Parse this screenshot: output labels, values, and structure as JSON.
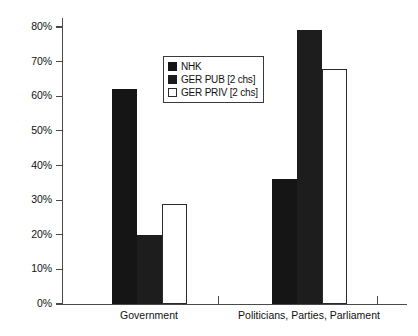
{
  "chart_data": {
    "type": "bar",
    "title": "",
    "subtitle": "",
    "xlabel": "",
    "ylabel": "",
    "categories": [
      "Government",
      "Politicians, Parties, Parliament"
    ],
    "series": [
      {
        "name": "NHK",
        "values": [
          62,
          36
        ],
        "swatch": "dark",
        "color": "#141414"
      },
      {
        "name": "GER PUB [2 chs]",
        "values": [
          20,
          79
        ],
        "swatch": "mid",
        "color": "#1c1c1c"
      },
      {
        "name": "GER PRIV [2 chs]",
        "values": [
          29,
          68
        ],
        "swatch": "white",
        "color": "#ffffff"
      }
    ],
    "ylim": [
      0,
      80
    ],
    "ytick_values": [
      0,
      10,
      20,
      30,
      40,
      50,
      60,
      70,
      80
    ],
    "ytick_labels": [
      "0%",
      "10%",
      "20%",
      "30%",
      "40%",
      "50%",
      "60%",
      "70%",
      "80%"
    ],
    "value_suffix": "%",
    "grid": false,
    "legend_position": "upper-center"
  },
  "legend": {
    "entries": [
      {
        "label": "NHK"
      },
      {
        "label": "GER PUB [2 chs]"
      },
      {
        "label": "GER PRIV [2 chs]"
      }
    ]
  },
  "axes": {
    "y_labels": [
      "80%",
      "70%",
      "60%",
      "50%",
      "40%",
      "30%",
      "20%",
      "10%",
      "0%"
    ],
    "x_labels": [
      "Government",
      "Politicians, Parties, Parliament"
    ]
  }
}
